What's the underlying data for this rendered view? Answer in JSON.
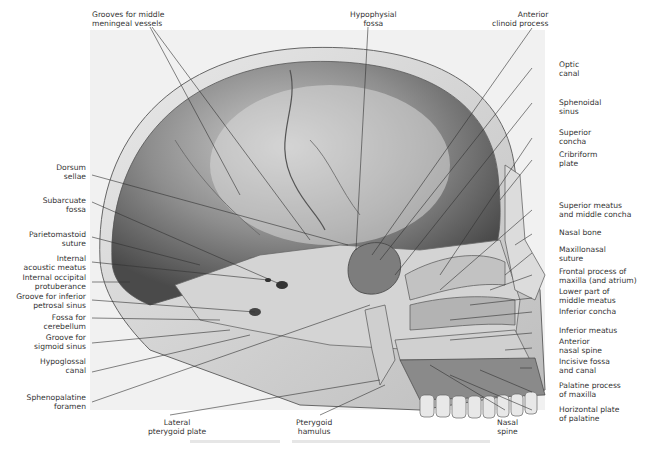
{
  "figure": {
    "labels_top": [
      {
        "id": "grooves-meningeal",
        "lines": [
          "Grooves for middle",
          "meningeal vessels"
        ]
      },
      {
        "id": "hypophysial-fossa",
        "lines": [
          "Hypophysial",
          "fossa"
        ]
      },
      {
        "id": "anterior-clinoid",
        "lines": [
          "Anterior",
          "clinoid process"
        ]
      }
    ],
    "labels_right": [
      {
        "id": "optic-canal",
        "lines": [
          "Optic",
          "canal"
        ]
      },
      {
        "id": "sphenoidal-sinus",
        "lines": [
          "Sphenoidal",
          "sinus"
        ]
      },
      {
        "id": "superior-concha",
        "lines": [
          "Superior",
          "concha"
        ]
      },
      {
        "id": "cribriform-plate",
        "lines": [
          "Cribriform",
          "plate"
        ]
      },
      {
        "id": "superior-meatus",
        "lines": [
          "Superior meatus",
          "and middle concha"
        ]
      },
      {
        "id": "nasal-bone",
        "lines": [
          "Nasal bone"
        ]
      },
      {
        "id": "maxillonasal-suture",
        "lines": [
          "Maxillonasal",
          "suture"
        ]
      },
      {
        "id": "frontal-process",
        "lines": [
          "Frontal process of",
          "maxilla (and atrium)"
        ]
      },
      {
        "id": "lower-middle-meatus",
        "lines": [
          "Lower part of",
          "middle meatus"
        ]
      },
      {
        "id": "inferior-concha",
        "lines": [
          "Inferior concha"
        ]
      },
      {
        "id": "inferior-meatus",
        "lines": [
          "Inferior meatus"
        ]
      },
      {
        "id": "anterior-nasal-spine",
        "lines": [
          "Anterior",
          "nasal spine"
        ]
      },
      {
        "id": "incisive-fossa",
        "lines": [
          "Incisive fossa",
          "and canal"
        ]
      },
      {
        "id": "palatine-process",
        "lines": [
          "Palatine process",
          "of maxilla"
        ]
      },
      {
        "id": "horizontal-plate",
        "lines": [
          "Horizontal plate",
          "of palatine"
        ]
      }
    ],
    "labels_left": [
      {
        "id": "dorsum-sellae",
        "lines": [
          "Dorsum",
          "sellae"
        ]
      },
      {
        "id": "subarcuate-fossa",
        "lines": [
          "Subarcuate",
          "fossa"
        ]
      },
      {
        "id": "parietomastoid-suture",
        "lines": [
          "Parietomastoid",
          "suture"
        ]
      },
      {
        "id": "internal-acoustic-meatus",
        "lines": [
          "Internal",
          "acoustic meatus"
        ]
      },
      {
        "id": "internal-occipital-protuberance",
        "lines": [
          "Internal occipital",
          "protuberance"
        ]
      },
      {
        "id": "groove-inferior-petrosal",
        "lines": [
          "Groove for inferior",
          "petrosal sinus"
        ]
      },
      {
        "id": "fossa-cerebellum",
        "lines": [
          "Fossa for",
          "cerebellum"
        ]
      },
      {
        "id": "groove-sigmoid",
        "lines": [
          "Groove for",
          "sigmoid sinus"
        ]
      },
      {
        "id": "hypoglossal-canal",
        "lines": [
          "Hypoglossal",
          "canal"
        ]
      },
      {
        "id": "sphenopalatine-foramen",
        "lines": [
          "Sphenopalatine",
          "foramen"
        ]
      }
    ],
    "labels_bottom": [
      {
        "id": "lateral-pterygoid-plate",
        "lines": [
          "Lateral",
          "pterygoid plate"
        ]
      },
      {
        "id": "pterygoid-hamulus",
        "lines": [
          "Pterygoid",
          "hamulus"
        ]
      },
      {
        "id": "nasal-spine",
        "lines": [
          "Nasal",
          "spine"
        ]
      }
    ]
  }
}
